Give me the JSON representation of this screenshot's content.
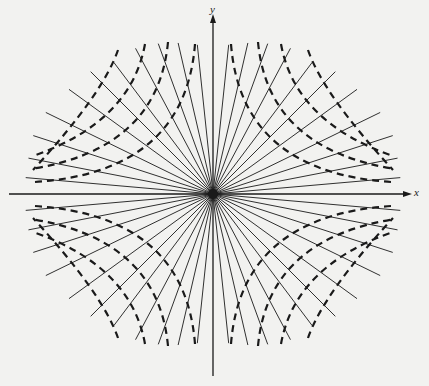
{
  "figure": {
    "width": 429,
    "height": 386,
    "background": "#f2f2f0",
    "ink_color": "#1a1a1a",
    "origin": [
      213,
      194
    ],
    "x_axis": {
      "label": "x",
      "from": 9,
      "to": 412,
      "label_pos": [
        414,
        190
      ]
    },
    "y_axis": {
      "label": "y",
      "from": 376,
      "to": 14,
      "label_pos": [
        210,
        3
      ]
    }
  },
  "solid_lines": {
    "description": "Family of straight lines through the origin",
    "style": {
      "stroke_width": 0.9,
      "dashed": false
    },
    "upper_right_quadrant": [
      {
        "angle_deg": 5,
        "length": 188
      },
      {
        "angle_deg": 11,
        "length": 188
      },
      {
        "angle_deg": 18,
        "length": 189
      },
      {
        "angle_deg": 26,
        "length": 186
      },
      {
        "angle_deg": 36,
        "length": 178
      },
      {
        "angle_deg": 45,
        "length": 173
      },
      {
        "angle_deg": 53,
        "length": 165
      },
      {
        "angle_deg": 62,
        "length": 165
      },
      {
        "angle_deg": 70,
        "length": 160
      },
      {
        "angle_deg": 77,
        "length": 155
      },
      {
        "angle_deg": 84,
        "length": 150
      }
    ],
    "mirrored_to_all_quadrants": true
  },
  "dashed_curves": {
    "description": "Family of orthogonal dashed curves, one set per quadrant",
    "style": {
      "stroke_width": 2.2,
      "dash": "7 5"
    },
    "upper_right_quadrant": [
      {
        "start": [
          18,
          150
        ],
        "control": [
          28,
          22
        ],
        "end": [
          178,
          12
        ]
      },
      {
        "start": [
          45,
          152
        ],
        "control": [
          55,
          45
        ],
        "end": [
          182,
          25
        ]
      },
      {
        "start": [
          68,
          150
        ],
        "control": [
          82,
          72
        ],
        "end": [
          180,
          38
        ]
      },
      {
        "start": [
          95,
          144
        ],
        "control": [
          110,
          100
        ],
        "end": [
          180,
          24
        ]
      }
    ],
    "mirrored_to_all_quadrants": true
  }
}
